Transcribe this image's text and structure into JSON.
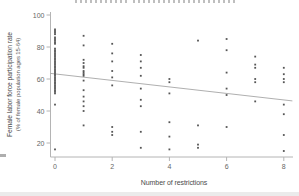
{
  "window": {
    "width": 299,
    "height": 196
  },
  "chart_data": {
    "type": "scatter",
    "title_cropped_visible": true,
    "xlabel": "Number of restrictions",
    "ylabel": [
      "Female labor force participation rate",
      "(% of female population ages 15-64)"
    ],
    "x_ticks": [
      0,
      2,
      4,
      6,
      8
    ],
    "y_ticks": [
      20,
      40,
      60,
      80,
      100
    ],
    "xlim": [
      -0.2,
      8.3
    ],
    "ylim": [
      11,
      103
    ],
    "grid": false,
    "legend": null,
    "marker": "small-square",
    "colors": {
      "marker": "#3d3d3d",
      "axis_line": "#b4b4b4",
      "tick_text": "#666666",
      "axis_label_text": "#4a4a4a",
      "trend_line": "#a6a6a6",
      "background": "#ffffff"
    },
    "series": [
      {
        "name": "countries",
        "points": [
          [
            0,
            91
          ],
          [
            0,
            90
          ],
          [
            0,
            89
          ],
          [
            0,
            88
          ],
          [
            0,
            86
          ],
          [
            0,
            85
          ],
          [
            0,
            84
          ],
          [
            0,
            83
          ],
          [
            0,
            82
          ],
          [
            0,
            79
          ],
          [
            0,
            78
          ],
          [
            0,
            77
          ],
          [
            0,
            76
          ],
          [
            0,
            75
          ],
          [
            0,
            74
          ],
          [
            0,
            73
          ],
          [
            0,
            72
          ],
          [
            0,
            71
          ],
          [
            0,
            70
          ],
          [
            0,
            69
          ],
          [
            0,
            68
          ],
          [
            0,
            67
          ],
          [
            0,
            66
          ],
          [
            0,
            65
          ],
          [
            0,
            64
          ],
          [
            0,
            63
          ],
          [
            0,
            62
          ],
          [
            0,
            61
          ],
          [
            0,
            60
          ],
          [
            0,
            59
          ],
          [
            0,
            58
          ],
          [
            0,
            57
          ],
          [
            0,
            56
          ],
          [
            0,
            55
          ],
          [
            0,
            54
          ],
          [
            0,
            53
          ],
          [
            0,
            52
          ],
          [
            0,
            51
          ],
          [
            0,
            44
          ],
          [
            0,
            16
          ],
          [
            1,
            87
          ],
          [
            1,
            81
          ],
          [
            1,
            72
          ],
          [
            1,
            70
          ],
          [
            1,
            68
          ],
          [
            1,
            67
          ],
          [
            1,
            65
          ],
          [
            1,
            64
          ],
          [
            1,
            63
          ],
          [
            1,
            62
          ],
          [
            1,
            59
          ],
          [
            1,
            53
          ],
          [
            1,
            49
          ],
          [
            1,
            46
          ],
          [
            1,
            43
          ],
          [
            1,
            40
          ],
          [
            1,
            31
          ],
          [
            2,
            82
          ],
          [
            2,
            76
          ],
          [
            2,
            71
          ],
          [
            2,
            65
          ],
          [
            2,
            61
          ],
          [
            2,
            56
          ],
          [
            2,
            30
          ],
          [
            2,
            27
          ],
          [
            2,
            25
          ],
          [
            3,
            75
          ],
          [
            3,
            71
          ],
          [
            3,
            67
          ],
          [
            3,
            62
          ],
          [
            3,
            54
          ],
          [
            3,
            47
          ],
          [
            3,
            43
          ],
          [
            3,
            27
          ],
          [
            3,
            17
          ],
          [
            4,
            60
          ],
          [
            4,
            58
          ],
          [
            4,
            51
          ],
          [
            4,
            33
          ],
          [
            4,
            24
          ],
          [
            4,
            16
          ],
          [
            5,
            84
          ],
          [
            5,
            31
          ],
          [
            5,
            19
          ],
          [
            5,
            17
          ],
          [
            6,
            85
          ],
          [
            6,
            78
          ],
          [
            6,
            64
          ],
          [
            6,
            54
          ],
          [
            6,
            50
          ],
          [
            6,
            30
          ],
          [
            7,
            74
          ],
          [
            7,
            69
          ],
          [
            7,
            67
          ],
          [
            7,
            60
          ],
          [
            7,
            58
          ],
          [
            7,
            46
          ],
          [
            8,
            67
          ],
          [
            8,
            63
          ],
          [
            8,
            60
          ],
          [
            8,
            58
          ],
          [
            8,
            44
          ],
          [
            8,
            38
          ],
          [
            8,
            25
          ],
          [
            8,
            15
          ]
        ]
      }
    ],
    "trend_line": {
      "x0": -0.2,
      "v0": 63.5,
      "x1": 8.3,
      "v1": 46.3
    }
  }
}
